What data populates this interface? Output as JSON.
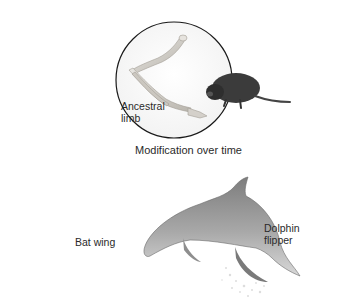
{
  "diagram": {
    "title": "Modification over time",
    "nodes": [
      {
        "id": "ancestral",
        "label": "Ancestral\nlimb",
        "illustration": "ancestral-limb-bones",
        "companion_animal": "shrew-like mammal"
      },
      {
        "id": "bat",
        "label": "Bat wing",
        "illustration": "bat-wing-bones",
        "companion_animal": "bat"
      },
      {
        "id": "dolphin",
        "label": "Dolphin\nflipper",
        "illustration": "dolphin-flipper-bones",
        "companion_animal": "dolphin"
      }
    ],
    "edges": [
      {
        "from": "ancestral",
        "to": "bat",
        "label": "Modification over time"
      },
      {
        "from": "ancestral",
        "to": "dolphin",
        "label": "Modification over time"
      }
    ],
    "colors": {
      "outline": "#1a1a1a",
      "bone": "#d9d6d0",
      "bone_shadow": "#a9a59e",
      "animal_dark": "#3a3a3a",
      "dolphin": "#9a9a9a"
    }
  }
}
